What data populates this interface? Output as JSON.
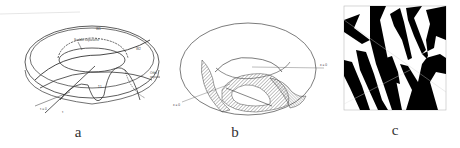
{
  "figure": {
    "panels": [
      {
        "id": "a",
        "caption": "a",
        "labels": {
          "outer_torus": "W1",
          "inner_region": "W2",
          "saddle_curve": "Saddle separatrix",
          "orbit_label": "Orbit separatrix",
          "sigma": "Σ1",
          "point_label": "ε2",
          "origin": "τ = 0",
          "tau": "τ",
          "axis_left": "f",
          "axis_right": "h"
        }
      },
      {
        "id": "b",
        "caption": "b",
        "labels": {
          "right_marker": "x = 0",
          "left_marker": "x = 0"
        }
      },
      {
        "id": "c",
        "caption": "c"
      }
    ]
  },
  "colors": {
    "line": "#333333",
    "ink": "#000000",
    "hatch": "#555555"
  }
}
